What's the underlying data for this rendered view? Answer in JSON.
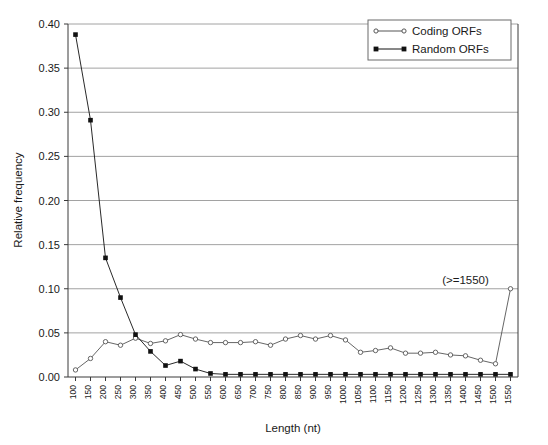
{
  "chart_data": {
    "type": "line",
    "title": "",
    "xlabel": "Length (nt)",
    "ylabel": "Relative frequency",
    "ylim": [
      0.0,
      0.4
    ],
    "yticks": [
      "0.00",
      "0.05",
      "0.10",
      "0.15",
      "0.20",
      "0.25",
      "0.30",
      "0.35",
      "0.40"
    ],
    "ytick_values": [
      0.0,
      0.05,
      0.1,
      0.15,
      0.2,
      0.25,
      0.3,
      0.35,
      0.4
    ],
    "grid": "horizontal",
    "legend_position": "top-right",
    "categories": [
      "100",
      "150",
      "200",
      "250",
      "300",
      "350",
      "400",
      "450",
      "500",
      "550",
      "600",
      "650",
      "700",
      "750",
      "800",
      "850",
      "900",
      "950",
      "1000",
      "1050",
      "1100",
      "1150",
      "1200",
      "1250",
      "1300",
      "1350",
      "1400",
      "1450",
      "1500",
      "1550"
    ],
    "series": [
      {
        "name": "Coding ORFs",
        "marker": "open-circle",
        "color": "#555555",
        "values": [
          0.008,
          0.021,
          0.04,
          0.036,
          0.044,
          0.038,
          0.041,
          0.048,
          0.043,
          0.039,
          0.039,
          0.039,
          0.04,
          0.036,
          0.043,
          0.047,
          0.043,
          0.047,
          0.042,
          0.028,
          0.03,
          0.033,
          0.027,
          0.027,
          0.028,
          0.025,
          0.024,
          0.019,
          0.015,
          0.1
        ]
      },
      {
        "name": "Random ORFs",
        "marker": "filled-square",
        "color": "#111111",
        "values": [
          0.388,
          0.291,
          0.135,
          0.09,
          0.048,
          0.029,
          0.013,
          0.018,
          0.009,
          0.004,
          0.003,
          0.003,
          0.003,
          0.003,
          0.003,
          0.003,
          0.003,
          0.003,
          0.003,
          0.003,
          0.003,
          0.003,
          0.003,
          0.003,
          0.003,
          0.003,
          0.003,
          0.003,
          0.003,
          0.003
        ]
      }
    ],
    "annotations": [
      {
        "text": "(>=1550)",
        "x_category": "1400",
        "y_value": 0.105
      }
    ]
  },
  "legend": {
    "entries": [
      {
        "label": "Coding ORFs"
      },
      {
        "label": "Random ORFs"
      }
    ]
  },
  "axes": {
    "x_title": "Length (nt)",
    "y_title": "Relative frequency"
  }
}
